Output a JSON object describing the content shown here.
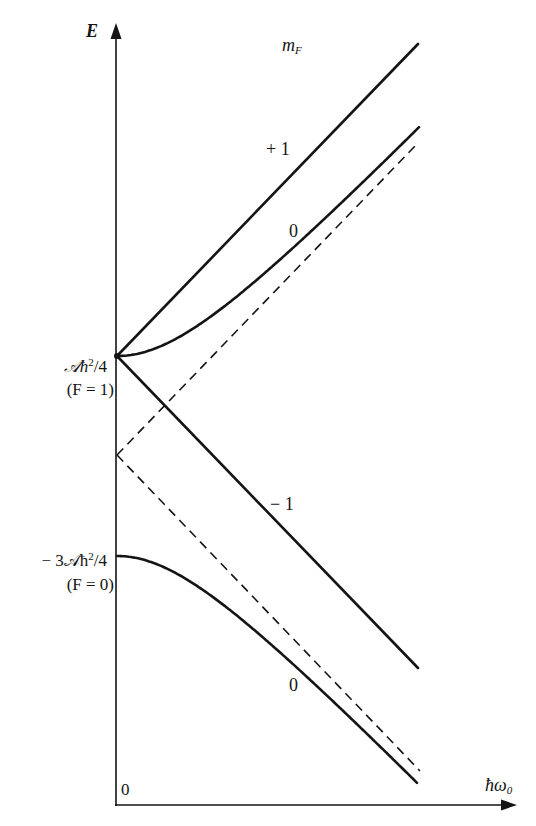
{
  "chart_data": {
    "type": "line",
    "xlabel": "ħω₀",
    "ylabel": "E",
    "x_origin_label": "0",
    "legend_title": "m_F",
    "y_tick_labels": [
      {
        "value_label": "𝒜ħ²/4",
        "sub_label": "(F = 1)"
      },
      {
        "value_label": "− 3𝒜ħ²/4",
        "sub_label": "(F = 0)"
      }
    ],
    "series": [
      {
        "name": "+1",
        "group": "F=1",
        "style": "solid",
        "shape": "straight line rising from 𝒜ħ²/4",
        "x": [
          0,
          1
        ],
        "y": [
          0.25,
          1.29
        ]
      },
      {
        "name": "0",
        "group": "F=1",
        "style": "solid",
        "shape": "hyperbola branch rising from 𝒜ħ²/4, asymptotic to upper dashed line",
        "x": [
          0,
          0.25,
          0.5,
          0.75,
          1
        ],
        "y": [
          0.25,
          0.31,
          0.46,
          0.65,
          0.85
        ]
      },
      {
        "name": "-1",
        "group": "F=1",
        "style": "solid",
        "shape": "straight line falling from 𝒜ħ²/4",
        "x": [
          0,
          1
        ],
        "y": [
          0.25,
          -0.79
        ]
      },
      {
        "name": "0",
        "group": "F=0",
        "style": "solid",
        "shape": "hyperbola branch falling from −3𝒜ħ²/4, asymptotic to lower dashed line",
        "x": [
          0,
          0.25,
          0.5,
          0.75,
          1
        ],
        "y": [
          -0.75,
          -0.81,
          -0.96,
          -1.15,
          -1.35
        ]
      },
      {
        "name": "asymptote-upper",
        "style": "dashed",
        "x": [
          0,
          1
        ],
        "y": [
          -0.25,
          0.79
        ]
      },
      {
        "name": "asymptote-lower",
        "style": "dashed",
        "x": [
          0,
          1
        ],
        "y": [
          -0.25,
          -1.29
        ]
      }
    ],
    "annotations": [
      "m_F",
      "+ 1",
      "0",
      "− 1",
      "0"
    ],
    "grid": false,
    "legend_position": "inline curve labels"
  },
  "labels": {
    "y_axis": "E",
    "x_axis_main": "ħω",
    "x_axis_sub": "0",
    "origin": "0",
    "mf_main": "m",
    "mf_sub": "F",
    "curve_plus1": "+ 1",
    "curve_zero_upper": "0",
    "curve_minus1": "− 1",
    "curve_zero_lower": "0",
    "f1_value_a": "𝒜ħ",
    "f1_value_sup": "2",
    "f1_value_b": "/4",
    "f1_state": "(F = 1)",
    "f0_value_a": "− 3𝒜ħ",
    "f0_value_sup": "2",
    "f0_value_b": "/4",
    "f0_state": "(F = 0)"
  },
  "colors": {
    "ink": "#141414",
    "background": "#ffffff"
  }
}
